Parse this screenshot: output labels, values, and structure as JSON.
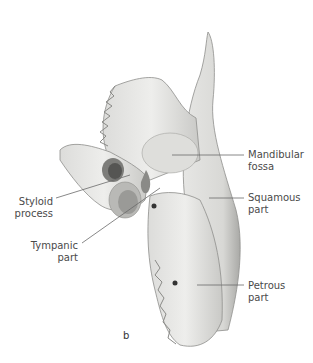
{
  "figure": {
    "panel_letter": "b",
    "labels": [
      {
        "id": "mandibular-fossa",
        "line1": "Mandibular",
        "line2": "fossa",
        "side": "right"
      },
      {
        "id": "squamous-part",
        "line1": "Squamous",
        "line2": "part",
        "side": "right"
      },
      {
        "id": "petrous-part",
        "line1": "Petrous",
        "line2": "part",
        "side": "right"
      },
      {
        "id": "styloid-process",
        "line1": "Styloid",
        "line2": "process",
        "side": "left"
      },
      {
        "id": "tympanic-part",
        "line1": "Tympanic",
        "line2": "part",
        "side": "left"
      }
    ]
  },
  "colors": {
    "bone_light": "#e9e9e7",
    "bone_mid": "#cfcfcc",
    "bone_dark": "#9a9a97",
    "leader_line": "#6a6a6a",
    "label_text": "#4a4a4a"
  }
}
